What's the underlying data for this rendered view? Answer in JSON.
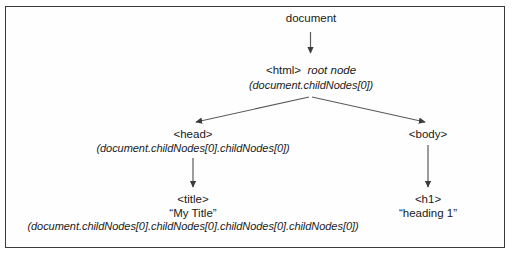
{
  "diagram": {
    "colors": {
      "ink": "#1a1a1a",
      "edge": "#555555",
      "border": "#3a3a3a",
      "background": "#ffffff"
    },
    "nodes": {
      "document": {
        "tag": "document"
      },
      "html": {
        "tag": "<html>",
        "note": "root node",
        "path": "(document.childNodes[0])"
      },
      "head": {
        "tag": "<head>",
        "path": "(document.childNodes[0].childNodes[0])"
      },
      "body": {
        "tag": "<body>"
      },
      "title": {
        "tag": "<title>",
        "value": "“My Title”",
        "path": "(document.childNodes[0].childNodes[0].childNodes[0].childNodes[0])"
      },
      "h1": {
        "tag": "<h1>",
        "value": "“heading 1”"
      }
    },
    "edges": [
      {
        "name": "document-to-html",
        "from": "document",
        "to": "html",
        "style": "vertical-arrow"
      },
      {
        "name": "html-to-head",
        "from": "html",
        "to": "head",
        "style": "diagonal-arrow"
      },
      {
        "name": "html-to-body",
        "from": "html",
        "to": "body",
        "style": "diagonal-arrow"
      },
      {
        "name": "head-to-title",
        "from": "head",
        "to": "title",
        "style": "vertical-arrow"
      },
      {
        "name": "body-to-h1",
        "from": "body",
        "to": "h1",
        "style": "vertical-arrow"
      }
    ]
  }
}
